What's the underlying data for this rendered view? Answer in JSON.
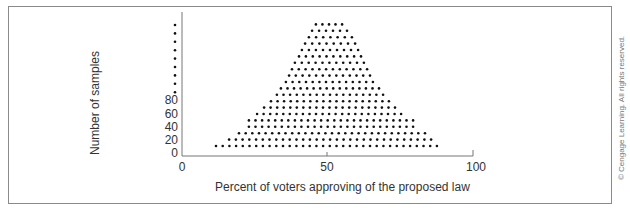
{
  "chart_data": {
    "type": "scatter",
    "subtype": "dot-histogram",
    "title": "",
    "xlabel": "Percent of voters approving of the proposed law",
    "ylabel": "Number of samples",
    "xlim": [
      0,
      100
    ],
    "x_ticks": [
      0,
      50,
      100
    ],
    "y_ticks": [
      0,
      20,
      40,
      60,
      80
    ],
    "y_axis_continuation": "dotted (axis continues upward beyond 80)",
    "grid": false,
    "legend": null,
    "rows": [
      {
        "level": 1,
        "x_start": 11.7,
        "x_end": 87.6
      },
      {
        "level": 2,
        "x_start": 16.2,
        "x_end": 85.6
      },
      {
        "level": 3,
        "x_start": 19.6,
        "x_end": 83.5
      },
      {
        "level": 4,
        "x_start": 23.0,
        "x_end": 79.4
      },
      {
        "level": 5,
        "x_start": 23.0,
        "x_end": 79.4
      },
      {
        "level": 6,
        "x_start": 25.8,
        "x_end": 75.3
      },
      {
        "level": 7,
        "x_start": 28.2,
        "x_end": 73.2
      },
      {
        "level": 8,
        "x_start": 30.6,
        "x_end": 71.1
      },
      {
        "level": 9,
        "x_start": 32.6,
        "x_end": 69.1
      },
      {
        "level": 10,
        "x_start": 34.0,
        "x_end": 67.7
      },
      {
        "level": 11,
        "x_start": 35.7,
        "x_end": 65.6
      },
      {
        "level": 12,
        "x_start": 36.8,
        "x_end": 64.6
      },
      {
        "level": 13,
        "x_start": 37.8,
        "x_end": 63.6
      },
      {
        "level": 14,
        "x_start": 38.8,
        "x_end": 62.5
      },
      {
        "level": 15,
        "x_start": 40.2,
        "x_end": 61.5
      },
      {
        "level": 16,
        "x_start": 41.2,
        "x_end": 60.5
      },
      {
        "level": 17,
        "x_start": 42.3,
        "x_end": 59.5
      },
      {
        "level": 18,
        "x_start": 43.6,
        "x_end": 58.4
      },
      {
        "level": 19,
        "x_start": 44.7,
        "x_end": 56.7
      },
      {
        "level": 20,
        "x_start": 46.0,
        "x_end": 55.0
      }
    ],
    "x_step": 2.3
  },
  "labels": {
    "ylabel": "Number of samples",
    "xlabel": "Percent of voters approving of the proposed law",
    "yticks": [
      "0",
      "20",
      "40",
      "60",
      "80"
    ],
    "xticks": [
      "0",
      "50",
      "100"
    ],
    "copyright": "© Cengage Learning. All rights reserved."
  },
  "colors": {
    "dot": "#111111",
    "axis": "#777777",
    "frame": "#8a8a8a"
  }
}
